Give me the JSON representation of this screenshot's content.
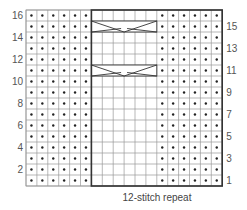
{
  "chart_title": "",
  "grid": {
    "columns": 18,
    "rows": 16,
    "left": 26,
    "top": 10,
    "cell_width": 10.9,
    "cell_height": 11,
    "line_color": "#9a9a9a",
    "bold_line_color": "#333333",
    "dot_color": "#222222"
  },
  "columns_layout": [
    {
      "type": "purl",
      "count": 6
    },
    {
      "type": "knit",
      "count": 6
    },
    {
      "type": "purl",
      "count": 6
    }
  ],
  "repeat_box": {
    "start_col": 6,
    "end_col": 18,
    "label": "12-stitch repeat"
  },
  "cables": [
    {
      "row": 15,
      "start_col": 6,
      "span": 6
    },
    {
      "row": 11,
      "start_col": 6,
      "span": 6
    }
  ],
  "row_labels_left": [
    "16",
    "14",
    "12",
    "10",
    "8",
    "6",
    "4",
    "2"
  ],
  "row_labels_right": [
    "15",
    "13",
    "11",
    "9",
    "7",
    "5",
    "3",
    "1"
  ],
  "caption": "12-stitch repeat",
  "legend": {
    "purl_symbol": "dot",
    "knit_symbol": "blank",
    "cable_symbol": "cross"
  }
}
